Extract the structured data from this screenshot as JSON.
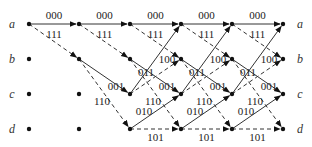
{
  "diagram": {
    "type": "trellis",
    "states": [
      "a",
      "b",
      "c",
      "d"
    ],
    "columns": 6,
    "column_x": [
      29,
      79,
      130,
      181,
      232,
      283
    ],
    "row_y": {
      "a": 24,
      "b": 59,
      "c": 94,
      "d": 129
    },
    "colors": {
      "line": "#333333",
      "node": "#111111",
      "text": "#222222"
    },
    "transitions": [
      {
        "from": "a",
        "to": "a",
        "output": "000",
        "style": "solid"
      },
      {
        "from": "a",
        "to": "b",
        "output": "111",
        "style": "dashed"
      },
      {
        "from": "b",
        "to": "c",
        "output": "001",
        "style": "solid"
      },
      {
        "from": "b",
        "to": "d",
        "output": "110",
        "style": "dashed"
      },
      {
        "from": "c",
        "to": "a",
        "output": "011",
        "style": "solid"
      },
      {
        "from": "c",
        "to": "b",
        "output": "100",
        "style": "dashed"
      },
      {
        "from": "d",
        "to": "c",
        "output": "010",
        "style": "solid"
      },
      {
        "from": "d",
        "to": "d",
        "output": "101",
        "style": "dashed"
      }
    ],
    "left_labels": [
      "a",
      "b",
      "c",
      "d"
    ],
    "right_labels": [
      "a",
      "b",
      "c",
      "d"
    ]
  }
}
